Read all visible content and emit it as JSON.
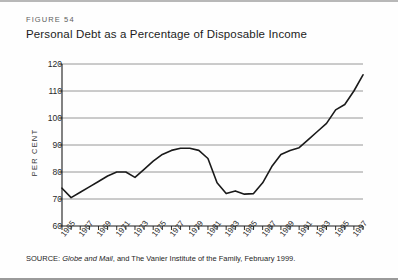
{
  "figure": {
    "number": "FIGURE 54",
    "title": "Personal Debt as a Percentage of Disposable Income",
    "source_prefix": "SOURCE:",
    "source_italic": "Globe and Mail",
    "source_rest": ", and The Vanier Institute of the Family, February 1999."
  },
  "colors": {
    "line": "#1a1a1a",
    "grid": "#8c8c8c",
    "axis": "#1a1a1a",
    "text": "#1c1c1c",
    "background": "#fefefe"
  },
  "chart_data": {
    "type": "line",
    "title": "Personal Debt as a Percentage of Disposable Income",
    "xlabel": "",
    "ylabel": "PER CENT",
    "ylim": [
      60,
      120
    ],
    "xlim": [
      1965,
      1998
    ],
    "ytick_labels": [
      "120",
      "110",
      "100",
      "90",
      "80",
      "70",
      "60"
    ],
    "ytick_values": [
      120,
      110,
      100,
      90,
      80,
      70,
      60
    ],
    "xtick_labels": [
      "1965",
      "1967",
      "1969",
      "1971",
      "1973",
      "1975",
      "1977",
      "1979",
      "1981",
      "1983",
      "1985",
      "1987",
      "1989",
      "1991",
      "1993",
      "1995",
      "1997"
    ],
    "xtick_values": [
      1965,
      1967,
      1969,
      1971,
      1973,
      1975,
      1977,
      1979,
      1981,
      1983,
      1985,
      1987,
      1989,
      1991,
      1993,
      1995,
      1997
    ],
    "grid": "horizontal",
    "legend": "none",
    "x": [
      1965,
      1966,
      1967,
      1968,
      1969,
      1970,
      1971,
      1972,
      1973,
      1974,
      1975,
      1976,
      1977,
      1978,
      1979,
      1980,
      1981,
      1982,
      1983,
      1984,
      1985,
      1986,
      1987,
      1988,
      1989,
      1990,
      1991,
      1992,
      1993,
      1994,
      1995,
      1996,
      1997,
      1998
    ],
    "values": [
      74.0,
      70.5,
      72.5,
      74.5,
      76.5,
      78.5,
      80.0,
      80.0,
      78.0,
      81.0,
      84.0,
      86.5,
      88.0,
      88.8,
      88.8,
      88.0,
      85.0,
      76.0,
      72.0,
      73.0,
      71.8,
      72.0,
      76.0,
      82.0,
      86.5,
      88.0,
      89.0,
      92.0,
      95.0,
      98.0,
      103.0,
      105.0,
      110.0,
      116.0
    ]
  }
}
